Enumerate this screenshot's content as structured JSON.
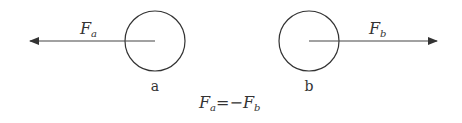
{
  "diagram": {
    "object_a": {
      "label": "a",
      "force_symbol": "F",
      "force_subscript": "a",
      "force_direction": "left"
    },
    "object_b": {
      "label": "b",
      "force_symbol": "F",
      "force_subscript": "b",
      "force_direction": "right"
    },
    "equation": {
      "lhs_symbol": "F",
      "lhs_subscript": "a",
      "operator": "=",
      "sign": "−",
      "rhs_symbol": "F",
      "rhs_subscript": "b"
    },
    "colors": {
      "stroke": "#333333",
      "background": "#ffffff"
    }
  }
}
